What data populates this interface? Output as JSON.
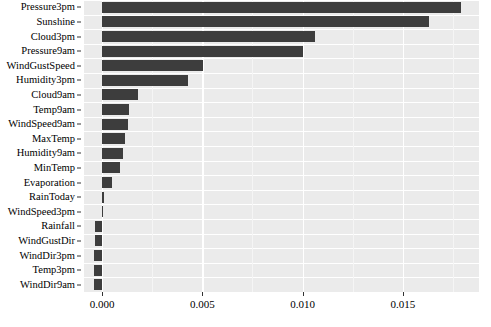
{
  "chart_data": {
    "type": "bar",
    "orientation": "horizontal",
    "title": "",
    "xlabel": "",
    "ylabel": "",
    "xlim": [
      -0.0009,
      0.0188
    ],
    "xticks": [
      0.0,
      0.005,
      0.01,
      0.015
    ],
    "xtick_labels": [
      "0.000",
      "0.005",
      "0.010",
      "0.015"
    ],
    "grid": true,
    "grid_axis": "both",
    "minor_gridlines": [
      0.0025,
      0.0075,
      0.0125,
      0.0175
    ],
    "legend": null,
    "bar_color": "#3d3d3d",
    "panel_color": "#ebebeb",
    "categories": [
      "Pressure3pm",
      "Sunshine",
      "Cloud3pm",
      "Pressure9am",
      "WindGustSpeed",
      "Humidity3pm",
      "Cloud9am",
      "Temp9am",
      "WindSpeed9am",
      "MaxTemp",
      "Humidity9am",
      "MinTemp",
      "Evaporation",
      "RainToday",
      "WindSpeed3pm",
      "Rainfall",
      "WindGustDir",
      "WindDir3pm",
      "Temp3pm",
      "WindDir9am"
    ],
    "values": [
      0.0179,
      0.01629,
      0.01062,
      0.01,
      0.00505,
      0.00429,
      0.00181,
      0.00133,
      0.00129,
      0.00114,
      0.00105,
      0.0009,
      0.00052,
      0.0001,
      0.0,
      -0.00033,
      -0.00033,
      -0.00038,
      -0.00038,
      -0.00038
    ]
  }
}
